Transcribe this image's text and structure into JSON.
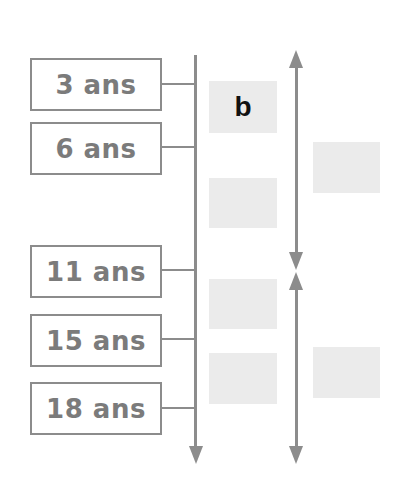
{
  "diagram": {
    "ages": [
      {
        "label": "3 ans"
      },
      {
        "label": "6 ans"
      },
      {
        "label": "11 ans"
      },
      {
        "label": "15 ans"
      },
      {
        "label": "18 ans"
      }
    ],
    "slots_left": [
      {
        "label": "b"
      },
      {
        "label": ""
      },
      {
        "label": ""
      },
      {
        "label": ""
      }
    ],
    "slots_right": [
      {
        "label": ""
      },
      {
        "label": ""
      }
    ],
    "colors": {
      "line": "#8c8c8c",
      "age_text": "#7b7b7b",
      "slot_fill": "#ebebeb",
      "slot_text": "#111111"
    }
  }
}
